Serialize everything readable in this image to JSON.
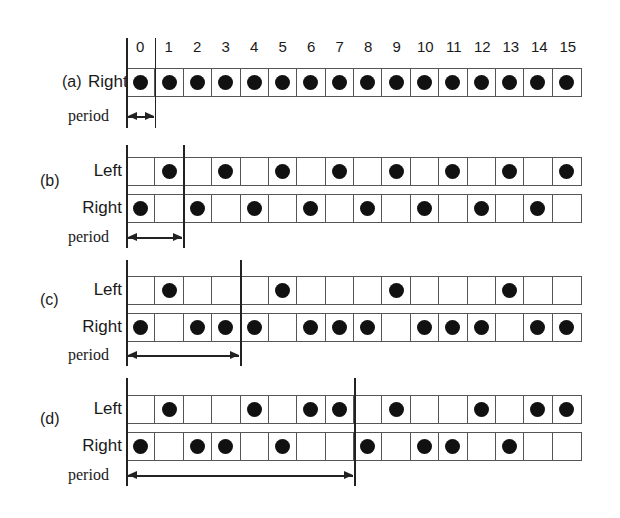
{
  "header": {
    "columns": [
      "0",
      "1",
      "2",
      "3",
      "4",
      "5",
      "6",
      "7",
      "8",
      "9",
      "10",
      "11",
      "12",
      "13",
      "14",
      "15"
    ]
  },
  "labels": {
    "left": "Left",
    "right": "Right",
    "period": "period"
  },
  "sections": [
    {
      "id": "(a)",
      "period_cells": 1,
      "left": null,
      "right": [
        1,
        1,
        1,
        1,
        1,
        1,
        1,
        1,
        1,
        1,
        1,
        1,
        1,
        1,
        1,
        1
      ]
    },
    {
      "id": "(b)",
      "period_cells": 2,
      "left": [
        0,
        1,
        0,
        1,
        0,
        1,
        0,
        1,
        0,
        1,
        0,
        1,
        0,
        1,
        0,
        1
      ],
      "right": [
        1,
        0,
        1,
        0,
        1,
        0,
        1,
        0,
        1,
        0,
        1,
        0,
        1,
        0,
        1,
        0
      ]
    },
    {
      "id": "(c)",
      "period_cells": 4,
      "left": [
        0,
        1,
        0,
        0,
        0,
        1,
        0,
        0,
        0,
        1,
        0,
        0,
        0,
        1,
        0,
        0
      ],
      "right": [
        1,
        0,
        1,
        1,
        1,
        0,
        1,
        1,
        1,
        0,
        1,
        1,
        1,
        0,
        1,
        1
      ]
    },
    {
      "id": "(d)",
      "period_cells": 8,
      "left": [
        0,
        1,
        0,
        0,
        1,
        0,
        1,
        1,
        0,
        1,
        0,
        0,
        1,
        0,
        1,
        1
      ],
      "right": [
        1,
        0,
        1,
        1,
        0,
        1,
        0,
        0,
        1,
        0,
        1,
        1,
        0,
        1,
        0,
        0
      ]
    }
  ],
  "colors": {
    "dot": "#111111",
    "grid": "#555555",
    "line": "#222222"
  }
}
